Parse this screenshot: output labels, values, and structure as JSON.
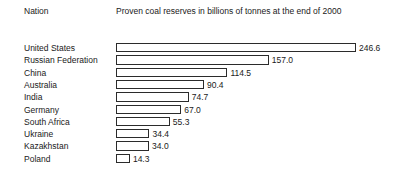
{
  "header": {
    "col_nation": "Nation",
    "col_measure": "Proven coal reserves in billions of tonnes at the end of 2000"
  },
  "chart_data": {
    "type": "bar",
    "orientation": "horizontal",
    "title": "Proven coal reserves in billions of tonnes at the end of 2000",
    "xlabel": "Proven coal reserves in billions of tonnes at the end of 2000",
    "ylabel": "Nation",
    "grid": false,
    "legend": false,
    "xlim": [
      0,
      246.6
    ],
    "categories": [
      "United States",
      "Russian Federation",
      "China",
      "Australia",
      "India",
      "Germany",
      "South Africa",
      "Ukraine",
      "Kazakhstan",
      "Poland"
    ],
    "values": [
      246.6,
      157.0,
      114.5,
      90.4,
      74.7,
      67.0,
      55.3,
      34.4,
      34.0,
      14.3
    ],
    "value_labels": [
      "246.6",
      "157.0",
      "114.5",
      "90.4",
      "74.7",
      "67.0",
      "55.3",
      "34.4",
      "34.0",
      "14.3"
    ],
    "bar_fill": "#ffffff",
    "bar_stroke": "#2b2b2b",
    "background": "#ffffff",
    "text_color": "#1a1a1a"
  }
}
